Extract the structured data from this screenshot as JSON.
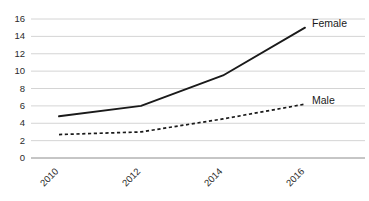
{
  "chart_data": {
    "type": "line",
    "title": "",
    "xlabel": "",
    "ylabel": "",
    "categories": [
      "2010",
      "2012",
      "2014",
      "2016"
    ],
    "x": [
      2010,
      2012,
      2014,
      2016
    ],
    "ylim": [
      0,
      16
    ],
    "ytick_step": 2,
    "yticks": [
      "0",
      "2",
      "4",
      "6",
      "8",
      "10",
      "12",
      "14",
      "16"
    ],
    "ytick_values": [
      0,
      2,
      4,
      6,
      8,
      10,
      12,
      14,
      16
    ],
    "grid": true,
    "legend_position": "at-line-end",
    "series": [
      {
        "name": "Female",
        "style": "solid",
        "color": "#1a1a1a",
        "values": [
          4.8,
          6.0,
          9.5,
          15.0
        ]
      },
      {
        "name": "Male",
        "style": "dashed",
        "color": "#1a1a1a",
        "values": [
          2.7,
          3.0,
          4.5,
          6.2
        ]
      }
    ],
    "xtick_rotation": 45
  },
  "colors": {
    "gridline": "#c9c9c9",
    "axis": "#9a9a9a",
    "line": "#1a1a1a",
    "background": "#ffffff",
    "tick_text": "#2b2b2b"
  }
}
